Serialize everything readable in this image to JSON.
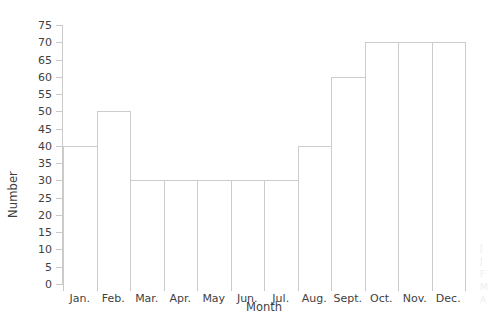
{
  "chart_data": {
    "type": "bar",
    "title": "",
    "subtitle": "",
    "xlabel": "Month",
    "ylabel": "Number",
    "categories": [
      "Jan.",
      "Feb.",
      "Mar.",
      "Apr.",
      "May",
      "Jun.",
      "Jul.",
      "Aug.",
      "Sept.",
      "Oct.",
      "Nov.",
      "Dec."
    ],
    "values": [
      40,
      50,
      30,
      30,
      30,
      30,
      30,
      40,
      60,
      70,
      70,
      70
    ],
    "ylim": [
      0,
      75
    ],
    "yticks": [
      0,
      5,
      10,
      15,
      20,
      25,
      30,
      35,
      40,
      45,
      50,
      55,
      60,
      65,
      70,
      75
    ],
    "ytick_labels": [
      "0",
      "5",
      "10",
      "15",
      "20",
      "25",
      "30",
      "35",
      "40",
      "45",
      "50",
      "55",
      "60",
      "65",
      "70",
      "75"
    ],
    "grid": false,
    "legend": null,
    "legend_position": "none",
    "bar_style": "contiguous-histogram",
    "bar_fill_color": "#ffffff",
    "bar_edge_color": "#cccccc",
    "axis_color": "#c9c9c9",
    "text_color": "#3f3f3f",
    "background_color": "#ffffff",
    "annotations": []
  },
  "edge_marks": [
    "J",
    "J",
    "F",
    "M",
    "A"
  ]
}
